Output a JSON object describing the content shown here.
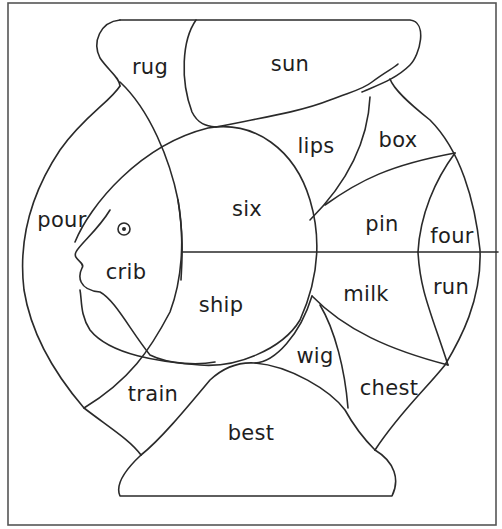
{
  "diagram": {
    "title": "",
    "regions": [
      {
        "id": "rug",
        "label": "rug",
        "x": 150,
        "y": 67
      },
      {
        "id": "sun",
        "label": "sun",
        "x": 290,
        "y": 64
      },
      {
        "id": "lips",
        "label": "lips",
        "x": 316,
        "y": 146
      },
      {
        "id": "box",
        "label": "box",
        "x": 398,
        "y": 140
      },
      {
        "id": "pour",
        "label": "pour",
        "x": 62,
        "y": 220
      },
      {
        "id": "six",
        "label": "six",
        "x": 247,
        "y": 209
      },
      {
        "id": "pin",
        "label": "pin",
        "x": 382,
        "y": 224
      },
      {
        "id": "four",
        "label": "four",
        "x": 452,
        "y": 236
      },
      {
        "id": "crib",
        "label": "crib",
        "x": 126,
        "y": 272
      },
      {
        "id": "ship",
        "label": "ship",
        "x": 221,
        "y": 305
      },
      {
        "id": "milk",
        "label": "milk",
        "x": 366,
        "y": 294
      },
      {
        "id": "run",
        "label": "run",
        "x": 451,
        "y": 287
      },
      {
        "id": "wig",
        "label": "wig",
        "x": 315,
        "y": 356
      },
      {
        "id": "chest",
        "label": "chest",
        "x": 389,
        "y": 388
      },
      {
        "id": "train",
        "label": "train",
        "x": 153,
        "y": 394
      },
      {
        "id": "best",
        "label": "best",
        "x": 251,
        "y": 433
      }
    ],
    "colors": {
      "stroke": "#2a2a2a",
      "frame": "#555555",
      "background": "#ffffff",
      "text": "#1e1e1e"
    }
  }
}
